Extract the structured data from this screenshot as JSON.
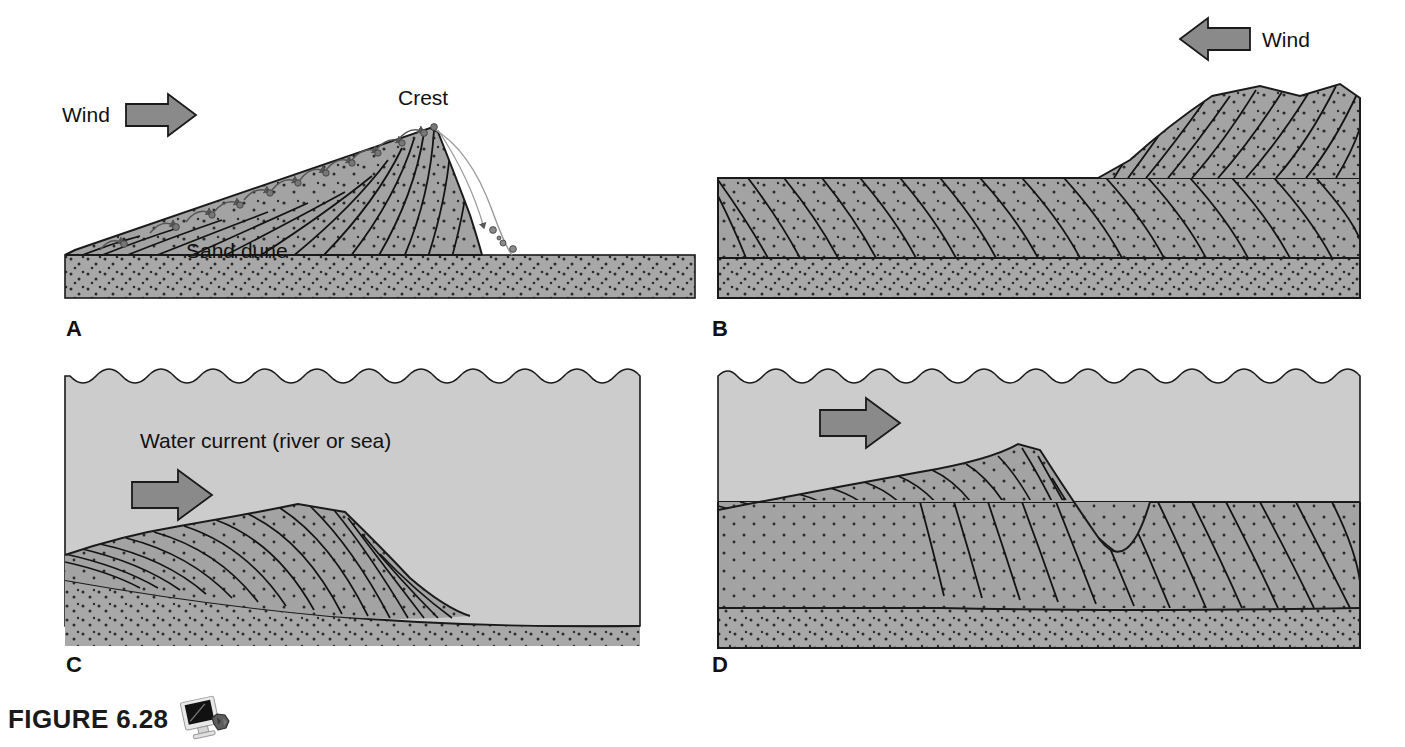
{
  "figure": {
    "caption_label": "FIGURE 6.28",
    "icon": "computer-monitor-rock-icon"
  },
  "colors": {
    "sand_dune": "#a3a3a3",
    "substrate": "#a8a8a8",
    "water": "#cccccc",
    "arrow_fill": "#8a8a8a",
    "outline": "#1a1a1a",
    "stipple": "#2b2b2b",
    "background": "#ffffff"
  },
  "panels": [
    {
      "id": "A",
      "letter": "A",
      "medium": "wind",
      "arrow_direction": "right",
      "labels": {
        "wind": "Wind",
        "crest": "Crest",
        "dune": "Sand dune"
      },
      "description": "Active wind-blown sand dune with saltating grains on the windward slope, a crest, and a steep slipface with grains avalanching down",
      "features": [
        "saltation-arcs",
        "crest",
        "slipface",
        "cross-beds",
        "stippled-substrate"
      ]
    },
    {
      "id": "B",
      "letter": "B",
      "medium": "wind",
      "arrow_direction": "left",
      "labels": {
        "wind": "Wind"
      },
      "description": "Buried eolian cross-bedded sandstone showing preserved dune foresets beneath a truncating bounding surface",
      "features": [
        "cross-beds",
        "bounding-surface",
        "stippled-substrate"
      ]
    },
    {
      "id": "C",
      "letter": "C",
      "medium": "water",
      "arrow_direction": "right",
      "labels": {
        "current": "Water current (river or sea)"
      },
      "description": "Subaqueous sand wave migrating beneath a water current, with cross-beds building out on the lee side",
      "features": [
        "water-surface-waves",
        "current-arrow",
        "cross-beds",
        "stippled-substrate"
      ]
    },
    {
      "id": "D",
      "letter": "D",
      "medium": "water",
      "arrow_direction": "right",
      "description": "Larger subaqueous sand wave with cross-bed sets preserved below a bounding surface in the underlying sediment",
      "features": [
        "water-surface-waves",
        "current-arrow",
        "cross-beds",
        "bounding-surface",
        "stippled-substrate"
      ]
    }
  ]
}
